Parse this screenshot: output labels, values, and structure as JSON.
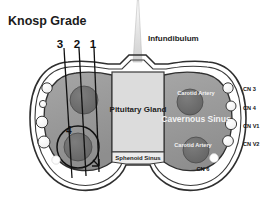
{
  "figure": {
    "title": "Knosp Grade",
    "type": "coronal-anatomical-diagram"
  },
  "grade_marks": {
    "labels": [
      "3",
      "2",
      "1"
    ],
    "note": "grade lines drawn through left cavernous sinus"
  },
  "structures": {
    "infundibulum": "Infundibulum",
    "pituitary_gland": "Pituitary Gland",
    "sphenoid_sinus": "Sphenoid Sinus",
    "cavernous_sinus": "Cavernous Sinus",
    "carotid_artery_superior": "Carotid Artery",
    "carotid_artery_inferior": "Carotid Artery",
    "grade_four_label": "4"
  },
  "cranial_nerves": [
    {
      "id": "cn3",
      "label": "CN 3"
    },
    {
      "id": "cn4",
      "label": "CN 4"
    },
    {
      "id": "cnv1",
      "label": "CN V1"
    },
    {
      "id": "cnv2",
      "label": "CN V2"
    },
    {
      "id": "cn6",
      "label": "CN 6"
    }
  ],
  "colors": {
    "background": "#ffffff",
    "outline": "#2b2b2b",
    "cavernous_sinus_fill": "#9a9a9a",
    "carotid_fill": "#6e6e6e",
    "pituitary_fill": "#d9d9d9",
    "sphenoid_fill": "#e6e6e6",
    "nerve_circle_fill": "#fbfbfb",
    "text_dark": "#1d1d1d",
    "text_light": "#f2f2f2"
  }
}
